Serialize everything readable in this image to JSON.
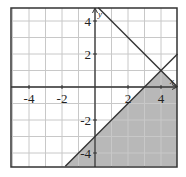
{
  "chart_data": {
    "type": "region",
    "title": "",
    "xlabel": "x",
    "ylabel": "y",
    "xlim": [
      -5,
      5
    ],
    "ylim": [
      -4.8,
      4.8
    ],
    "grid": true,
    "grid_step": 1,
    "x_ticks": [
      -4,
      -2,
      2,
      4
    ],
    "y_ticks": [
      4,
      2,
      -2,
      -4
    ],
    "x_tick_labels": [
      "-4",
      "-2",
      "2",
      "4"
    ],
    "y_tick_labels": [
      "4",
      "2",
      "-2",
      "-4"
    ],
    "lines": [
      {
        "name": "boundary-1",
        "equation": "y = -x + 5",
        "slope": -1,
        "intercept": 5,
        "style": "solid"
      },
      {
        "name": "boundary-2",
        "equation": "y = x - 3",
        "slope": 1,
        "intercept": -3,
        "style": "solid"
      }
    ],
    "intersection": [
      4,
      1
    ],
    "shaded_region": {
      "description": "y <= x - 3 and y <= -x + 5",
      "vertices": [
        [
          -1.8,
          -4.8
        ],
        [
          4,
          1
        ],
        [
          5,
          0
        ],
        [
          5,
          -4.8
        ]
      ],
      "color": "#b8b8b8"
    }
  },
  "colors": {
    "frame": "#333333",
    "grid": "#c8c8c8",
    "axis": "#333333",
    "line": "#333333",
    "shade": "#b8b8b8"
  }
}
